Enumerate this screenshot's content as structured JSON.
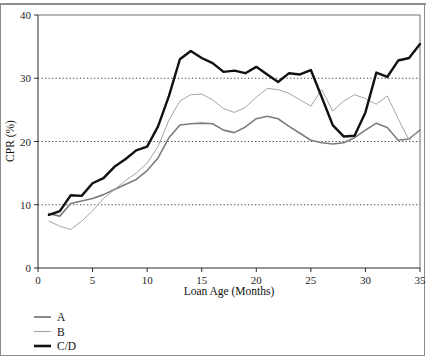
{
  "chart_data": {
    "type": "line",
    "title": "",
    "xlabel": "Loan Age (Months)",
    "ylabel": "CPR (%)",
    "xlim": [
      0,
      35
    ],
    "ylim": [
      0,
      40
    ],
    "xticks": [
      0,
      5,
      10,
      15,
      20,
      25,
      30,
      35
    ],
    "yticks": [
      0,
      10,
      20,
      30,
      40
    ],
    "grid": "horizontal-dotted-at-10-20-30",
    "legend_position": "below-left",
    "x": [
      1,
      2,
      3,
      4,
      5,
      6,
      7,
      8,
      9,
      10,
      11,
      12,
      13,
      14,
      15,
      16,
      17,
      18,
      19,
      20,
      21,
      22,
      23,
      24,
      25,
      26,
      27,
      28,
      29,
      30,
      31,
      32,
      33,
      34,
      35
    ],
    "series": [
      {
        "name": "A",
        "color": "#7d7d7d",
        "width": 1.6,
        "values": [
          8.6,
          8.2,
          10.2,
          10.6,
          11.0,
          11.6,
          12.4,
          13.2,
          14.0,
          15.4,
          17.4,
          20.6,
          22.6,
          22.8,
          22.9,
          22.8,
          21.8,
          21.4,
          22.3,
          23.6,
          24.0,
          23.6,
          22.4,
          21.3,
          20.2,
          19.8,
          19.6,
          19.8,
          20.6,
          21.8,
          22.9,
          22.2,
          20.2,
          20.4,
          21.8
        ]
      },
      {
        "name": "B",
        "color": "#a5a5a5",
        "width": 1.0,
        "values": [
          7.4,
          6.6,
          6.1,
          7.4,
          9.0,
          11.0,
          12.4,
          13.8,
          15.0,
          16.6,
          19.2,
          23.4,
          26.4,
          27.4,
          27.5,
          26.6,
          25.2,
          24.6,
          25.4,
          27.0,
          28.4,
          28.2,
          27.6,
          26.6,
          25.6,
          28.2,
          24.8,
          26.4,
          27.4,
          26.8,
          25.9,
          27.2,
          23.6,
          20.2,
          22.0
        ]
      },
      {
        "name": "C/D",
        "color": "#111111",
        "width": 2.4,
        "values": [
          8.4,
          9.0,
          11.5,
          11.4,
          13.4,
          14.2,
          16.0,
          17.2,
          18.6,
          19.2,
          22.4,
          27.2,
          33.0,
          34.3,
          33.2,
          32.4,
          31.0,
          31.2,
          30.8,
          31.8,
          30.6,
          29.4,
          30.8,
          30.6,
          31.3,
          27.0,
          22.6,
          20.8,
          20.9,
          24.6,
          30.9,
          30.2,
          32.8,
          33.2,
          35.4
        ]
      }
    ]
  },
  "axes": {
    "y_label": "CPR (%)",
    "x_label": "Loan Age (Months)",
    "y_tick_labels": [
      "0",
      "10",
      "20",
      "30",
      "40"
    ],
    "x_tick_labels": [
      "0",
      "5",
      "10",
      "15",
      "20",
      "25",
      "30",
      "35"
    ]
  },
  "legend": {
    "items": [
      {
        "label": "A",
        "color": "#7d7d7d",
        "width": 1.8
      },
      {
        "label": "B",
        "color": "#a5a5a5",
        "width": 1.1
      },
      {
        "label": "C/D",
        "color": "#111111",
        "width": 2.6
      }
    ]
  },
  "geometry": {
    "plot_left": 38,
    "plot_right": 420,
    "plot_top": 15,
    "plot_bottom": 268
  }
}
